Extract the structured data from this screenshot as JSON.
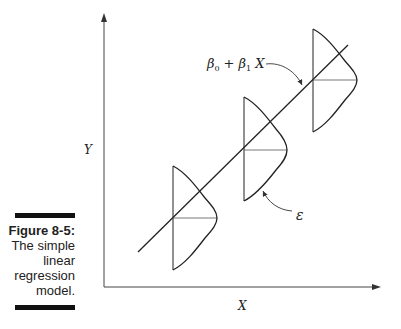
{
  "caption": {
    "figure_number": "Figure 8-5:",
    "lines": [
      "The simple",
      "linear",
      "regression",
      "model."
    ]
  },
  "diagram": {
    "x_axis_label": "X",
    "y_axis_label": "Y",
    "regression_label": {
      "beta0": "β",
      "beta0_sub": "0",
      "plus": "+",
      "beta1": "β",
      "beta1_sub": "1",
      "x": "X"
    },
    "error_label": "ε",
    "distributions": 3
  }
}
